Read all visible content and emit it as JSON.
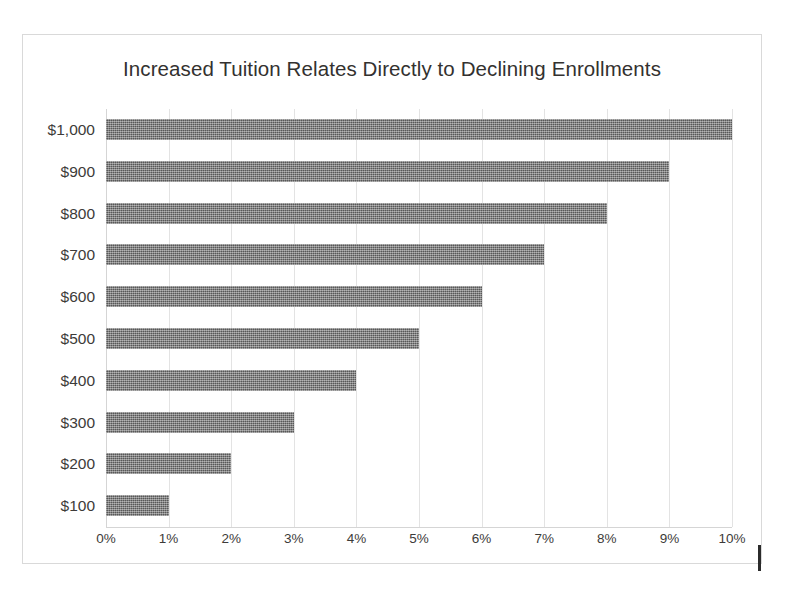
{
  "chart_data": {
    "type": "bar",
    "orientation": "horizontal",
    "title": "Increased Tuition Relates Directly to Declining Enrollments",
    "subtitle": "",
    "xlabel": "",
    "ylabel": "",
    "categories": [
      "$1,000",
      "$900",
      "$800",
      "$700",
      "$600",
      "$500",
      "$400",
      "$300",
      "$200",
      "$100"
    ],
    "values": [
      10,
      9,
      8,
      7,
      6,
      5,
      4,
      3,
      2,
      1
    ],
    "value_labels": [
      "10%",
      "9%",
      "8%",
      "7%",
      "6%",
      "5%",
      "4%",
      "3%",
      "2%",
      "1%"
    ],
    "xlim": [
      0,
      10
    ],
    "xticks": [
      0,
      1,
      2,
      3,
      4,
      5,
      6,
      7,
      8,
      9,
      10
    ],
    "xtick_labels": [
      "0%",
      "1%",
      "2%",
      "3%",
      "4%",
      "5%",
      "6%",
      "7%",
      "8%",
      "9%",
      "10%"
    ],
    "grid": true,
    "grid_axis": "x",
    "legend": false,
    "legend_position": "none",
    "series": [
      {
        "name": "Enrollment Decline",
        "values": [
          10,
          9,
          8,
          7,
          6,
          5,
          4,
          3,
          2,
          1
        ]
      }
    ]
  },
  "colors": {
    "bar_fill": "#6f6f6f",
    "gridline": "#e3e3e3",
    "axis_line": "#d5d5d5",
    "frame_border": "#d9d9d9",
    "title_text": "#33312f",
    "tick_text": "#3d3b39",
    "background": "#ffffff",
    "scan_artifact": "#2b2b2b"
  }
}
